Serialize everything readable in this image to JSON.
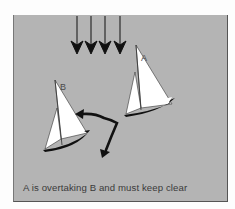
{
  "figure": {
    "caption": "A is overtaking B and must keep clear",
    "boats": [
      {
        "label": "A",
        "role": "overtaking"
      },
      {
        "label": "B",
        "role": "overtaken"
      }
    ],
    "wind_arrows": 4,
    "colors": {
      "background": "#b4b4b4",
      "sail": "#ffffff",
      "hull": "#111111",
      "arrow": "#111111",
      "text": "#3a3a3a"
    }
  }
}
